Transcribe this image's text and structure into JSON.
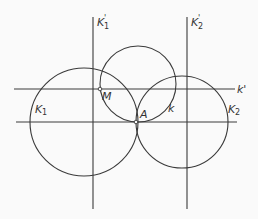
{
  "diagram": {
    "lines": [
      {
        "id": "K1-prime",
        "label": "K",
        "sub": "1",
        "sup": "'",
        "x1": 93,
        "y1": 17,
        "x2": 93,
        "y2": 209
      },
      {
        "id": "K2-prime",
        "label": "K",
        "sub": "2",
        "sup": "'",
        "x1": 187,
        "y1": 17,
        "x2": 187,
        "y2": 209
      },
      {
        "id": "k-prime",
        "label": "k'",
        "x1": 14,
        "y1": 89,
        "x2": 235,
        "y2": 89
      },
      {
        "id": "base",
        "label": "",
        "x1": 16,
        "y1": 122,
        "x2": 237,
        "y2": 122
      }
    ],
    "circles": [
      {
        "id": "K1",
        "label": "K",
        "sub": "1",
        "cx": 84,
        "cy": 122,
        "r": 54
      },
      {
        "id": "K2",
        "label": "K",
        "sub": "2",
        "cx": 182,
        "cy": 122,
        "r": 46
      },
      {
        "id": "k",
        "label": "k",
        "cx": 138,
        "cy": 84,
        "r": 38
      }
    ],
    "points": [
      {
        "id": "M",
        "label": "M",
        "x": 100,
        "y": 89
      },
      {
        "id": "A",
        "label": "A",
        "x": 136,
        "y": 122
      }
    ],
    "labels": {
      "K1_prime": "K",
      "K1_prime_sub": "1",
      "K2_prime": "K",
      "K2_prime_sub": "2",
      "prime": "'",
      "k_prime": "k'",
      "K1": "K",
      "K1_sub": "1",
      "K2": "K",
      "K2_sub": "2",
      "k": "k",
      "M": "M",
      "A": "A"
    }
  }
}
